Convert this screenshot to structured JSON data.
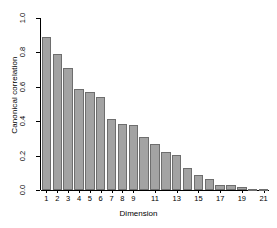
{
  "chart_data": {
    "type": "bar",
    "title": "",
    "xlabel": "Dimension",
    "ylabel": "Canonical correlation",
    "categories": [
      "1",
      "2",
      "3",
      "4",
      "5",
      "6",
      "7",
      "8",
      "9",
      "10",
      "11",
      "12",
      "13",
      "14",
      "15",
      "16",
      "17",
      "18",
      "19",
      "20",
      "21"
    ],
    "values": [
      0.89,
      0.79,
      0.71,
      0.59,
      0.57,
      0.54,
      0.41,
      0.385,
      0.38,
      0.31,
      0.265,
      0.22,
      0.205,
      0.13,
      0.09,
      0.065,
      0.03,
      0.03,
      0.015,
      0.006,
      0.003
    ],
    "ylim": [
      0.0,
      1.0
    ],
    "ytick_labels": [
      "0.0",
      "0.2",
      "0.4",
      "0.6",
      "0.8",
      "1.0"
    ],
    "ytick_values": [
      0.0,
      0.2,
      0.4,
      0.6,
      0.8,
      1.0
    ],
    "xtick_labels": [
      "1",
      "2",
      "3",
      "4",
      "5",
      "6",
      "7",
      "8",
      "9",
      "11",
      "13",
      "15",
      "17",
      "19",
      "21"
    ],
    "xtick_values": [
      1,
      2,
      3,
      4,
      5,
      6,
      7,
      8,
      9,
      11,
      13,
      15,
      17,
      19,
      21
    ],
    "grid": false,
    "legend": null,
    "bar_fill_color": "#a3a3a3",
    "bar_border_color": "#6e6e6e",
    "axis_color": "#000000",
    "background_color": "#ffffff"
  }
}
